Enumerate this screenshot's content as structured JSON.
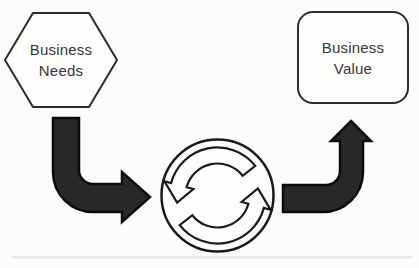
{
  "nodes": {
    "business_needs": {
      "line1": "Business",
      "line2": "Needs",
      "shape": "hexagon"
    },
    "business_value": {
      "line1": "Business",
      "line2": "Value",
      "shape": "rounded-rectangle"
    }
  },
  "icons": {
    "center_cycle": "cycle-icon",
    "left_connector": "elbow-arrow-down-right-icon",
    "right_connector": "elbow-arrow-right-up-icon"
  },
  "colors": {
    "background": "#fcfcfa",
    "shape_outline": "#2c2c2c",
    "arrow_fill": "#282828",
    "arrow_outline": "#0b0b0b",
    "text": "#383838",
    "artifact_line": "#eae8e3"
  }
}
